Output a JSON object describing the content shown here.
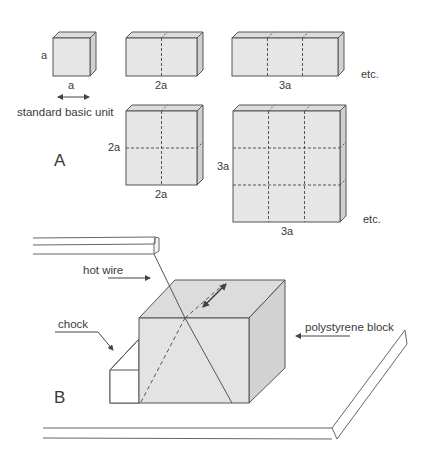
{
  "section_a": {
    "label": "A",
    "unit_caption": "standard basic unit",
    "blocks": [
      {
        "name": "unit-cube",
        "height_label": "a",
        "width_label": "a"
      },
      {
        "name": "double-block",
        "width_label": "2a"
      },
      {
        "name": "triple-block",
        "width_label": "3a",
        "continuation": "etc."
      },
      {
        "name": "square-2x2",
        "height_label": "2a",
        "width_label": "2a"
      },
      {
        "name": "square-3x3",
        "height_label": "3a",
        "width_label": "3a",
        "continuation": "etc."
      }
    ]
  },
  "section_b": {
    "label": "B",
    "callouts": {
      "hot_wire": "hot wire",
      "chock": "chock",
      "block": "polystyrene block"
    }
  },
  "colors": {
    "face_fill": "#e6e6e6",
    "side_fill": "#d4d4d4",
    "top_fill": "#dcdcdc",
    "stroke": "#555555"
  }
}
